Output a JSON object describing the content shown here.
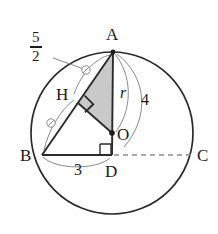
{
  "figure": {
    "background": "#ffffff",
    "stroke_dark": "#2b2b2b",
    "stroke_thin": "#8a8a8a",
    "shade_fill": "#c9c9c9",
    "canvas": {
      "width": 218,
      "height": 234
    },
    "circle": {
      "cx": 112,
      "cy": 133,
      "r": 81
    },
    "points": {
      "A": {
        "x": 113,
        "y": 52,
        "label": "A",
        "label_x": 106,
        "label_y": 26
      },
      "H": {
        "x": 78,
        "y": 103,
        "label": "H",
        "label_x": 56,
        "label_y": 86
      },
      "O": {
        "x": 112,
        "y": 133,
        "label": "O",
        "label_x": 117,
        "label_y": 126
      },
      "B": {
        "x": 42,
        "y": 155,
        "label": "B",
        "label_x": 20,
        "label_y": 147
      },
      "D": {
        "x": 112,
        "y": 155,
        "label": "D",
        "label_x": 105,
        "label_y": 163
      },
      "C": {
        "x": 193,
        "y": 155,
        "label": "C",
        "label_x": 197,
        "label_y": 147
      }
    },
    "measures": {
      "arc_AH": {
        "label_numerator": "5",
        "label_denominator": "2",
        "label_x": 36,
        "label_y": 30
      },
      "segment_AO": {
        "label": "r",
        "label_x": 120,
        "label_y": 85
      },
      "segment_AB": {
        "label": "4",
        "label_x": 141,
        "label_y": 92
      },
      "segment_BD": {
        "label": "3",
        "label_x": 74,
        "label_y": 162
      }
    },
    "marks": {
      "congruence_tick_upper": {
        "cx": 86,
        "cy": 70,
        "r": 4,
        "name": "congruence-mark-arc-AH"
      },
      "congruence_tick_lower": {
        "cx": 51,
        "cy": 123,
        "r": 4,
        "name": "congruence-mark-arc-HB"
      },
      "right_angle_H": {
        "name": "right-angle-at-H",
        "size": 11
      },
      "right_angle_D": {
        "name": "right-angle-at-D",
        "size": 11
      }
    },
    "shaded_triangle": {
      "vertices": "A,H,O",
      "fill": "#c9c9c9"
    },
    "dashed_segment": {
      "from": "D",
      "to": "C"
    }
  }
}
